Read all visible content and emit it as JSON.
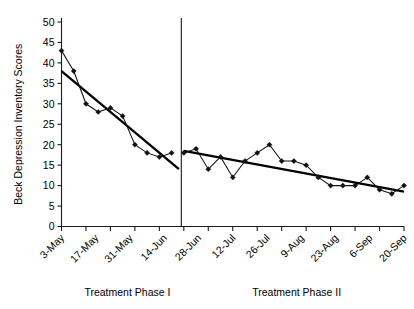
{
  "chart_data": {
    "type": "line",
    "title": "",
    "xlabel": "",
    "ylabel": "Beck Depression Inventory Scores",
    "ylim": [
      0,
      50
    ],
    "ytick_values": [
      0,
      5,
      10,
      15,
      20,
      25,
      30,
      35,
      40,
      45,
      50
    ],
    "ytick_labels": [
      "0",
      "5",
      "10",
      "15",
      "20",
      "25",
      "30",
      "35",
      "40",
      "45",
      "50"
    ],
    "grid": false,
    "legend": "none",
    "xtick_labels": [
      "3-May",
      "17-May",
      "31-May",
      "14-Jun",
      "28-Jun",
      "12-Jul",
      "26-Jul",
      "9-Aug",
      "23-Aug",
      "6-Sep",
      "20-Sep"
    ],
    "annotations": [
      {
        "text": "Treatment Phase I",
        "position": "below-axis-left"
      },
      {
        "text": "Treatment Phase II",
        "position": "below-axis-right"
      }
    ],
    "phase_divider_index": 10,
    "series": [
      {
        "name": "Beck Depression Inventory Scores",
        "marker": "diamond",
        "x_index": [
          0,
          1,
          2,
          3,
          4,
          5,
          6,
          7,
          8,
          9
        ],
        "values": [
          43,
          38,
          30,
          28,
          29,
          27,
          20,
          18,
          17,
          18
        ]
      },
      {
        "name": "Beck Depression Inventory Scores",
        "marker": "diamond",
        "x_index": [
          10,
          11,
          12,
          13,
          14,
          15,
          16,
          17,
          18,
          19,
          20,
          21,
          22,
          23,
          24,
          25,
          26,
          27,
          28
        ],
        "values": [
          18,
          19,
          14,
          17,
          12,
          16,
          18,
          20,
          16,
          16,
          15,
          12,
          10,
          10,
          10,
          12,
          9,
          8,
          10
        ]
      }
    ],
    "trend_lines": [
      {
        "name": "Phase I trend",
        "x_start_index": 0,
        "y_start": 38,
        "x_end_index": 9.6,
        "y_end": 14
      },
      {
        "name": "Phase II trend",
        "x_start_index": 10,
        "y_start": 18.5,
        "x_end_index": 28,
        "y_end": 8.5
      }
    ]
  },
  "axis": {
    "y_title": "Beck Depression Inventory Scores"
  },
  "phases": {
    "phase_one_label": "Treatment Phase I",
    "phase_two_label": "Treatment Phase II"
  }
}
